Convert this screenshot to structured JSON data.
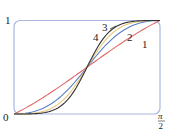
{
  "chart_data": {
    "type": "line",
    "title": "",
    "xlabel": "",
    "ylabel": "",
    "xlim": [
      0,
      1.5708
    ],
    "ylim": [
      0,
      1
    ],
    "x_tick_labels": [
      "0",
      "π/2"
    ],
    "y_tick_labels": [
      "1"
    ],
    "grid": false,
    "legend": "inline curve labels",
    "crossing_point": {
      "x": 0.7854,
      "y": 0.5
    },
    "series": [
      {
        "name": "1",
        "color": "#e06666",
        "shape": "near-linear S-curve",
        "steepness": 1
      },
      {
        "name": "2",
        "color": "#5b7fc7",
        "shape": "S-curve",
        "steepness": 2
      },
      {
        "name": "3",
        "color": "#e8c878",
        "shape": "S-curve",
        "steepness": 3
      },
      {
        "name": "4",
        "color": "#333333",
        "shape": "S-curve",
        "steepness": 4
      }
    ]
  },
  "labels": {
    "y_top": "1",
    "origin": "0",
    "x_right_num": "π",
    "x_right_den": "2",
    "curve1": "1",
    "curve2": "2",
    "curve3": "3",
    "curve4": "4"
  },
  "colors": {
    "frame": "#a9b8e0"
  }
}
